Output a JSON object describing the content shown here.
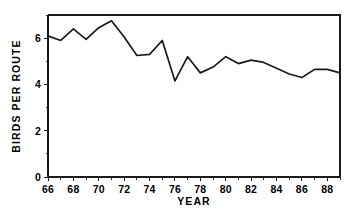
{
  "chart_data": {
    "type": "line",
    "title": "",
    "subtitle": "",
    "xlabel": "YEAR",
    "ylabel": "BIRDS PER ROUTE",
    "xlim": [
      66,
      89
    ],
    "ylim": [
      0,
      7
    ],
    "grid": false,
    "legend": false,
    "legend_position": "none",
    "line_color": "#1a1a1a",
    "x": [
      66,
      67,
      68,
      69,
      70,
      71,
      72,
      73,
      74,
      75,
      76,
      77,
      78,
      79,
      80,
      81,
      82,
      83,
      84,
      85,
      86,
      87,
      88,
      89
    ],
    "values": [
      6.1,
      5.9,
      6.4,
      5.95,
      6.45,
      6.75,
      6.05,
      5.25,
      5.3,
      5.9,
      4.15,
      5.2,
      4.5,
      4.75,
      5.2,
      4.9,
      5.05,
      4.95,
      4.7,
      4.45,
      4.3,
      4.65,
      4.65,
      4.5
    ],
    "series": [
      {
        "name": "Birds per route",
        "values": [
          6.1,
          5.9,
          6.4,
          5.95,
          6.45,
          6.75,
          6.05,
          5.25,
          5.3,
          5.9,
          4.15,
          5.2,
          4.5,
          4.75,
          5.2,
          4.9,
          5.05,
          4.95,
          4.7,
          4.45,
          4.3,
          4.65,
          4.65,
          4.5
        ]
      }
    ],
    "y_ticks_major": [
      0,
      2,
      4,
      6
    ],
    "y_tick_labels": [
      "0",
      "2",
      "4",
      "6"
    ],
    "y_ticks_minor": [
      1,
      3,
      5,
      7
    ],
    "x_ticks_major": [
      66,
      68,
      70,
      72,
      74,
      76,
      78,
      80,
      82,
      84,
      86,
      88
    ],
    "x_tick_labels": [
      "66",
      "68",
      "70",
      "72",
      "74",
      "76",
      "78",
      "80",
      "82",
      "84",
      "86",
      "88"
    ],
    "x_ticks_minor": [
      67,
      69,
      71,
      73,
      75,
      77,
      79,
      81,
      83,
      85,
      87,
      89
    ]
  },
  "axes": {
    "y_title": "BIRDS PER ROUTE",
    "x_title": "YEAR"
  }
}
